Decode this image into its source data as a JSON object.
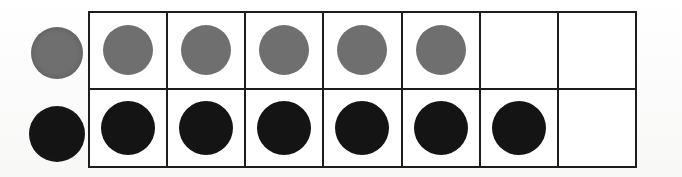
{
  "figure": {
    "background_color": "#ffffff",
    "border_color": "#1d1d1d",
    "border_width_px": 2
  },
  "key": {
    "name": "row-key-circles",
    "items": [
      {
        "name": "key-grey-circle",
        "color": "#6f6f6f",
        "shape": "circle",
        "row": "top",
        "diameter_px": 52
      },
      {
        "name": "key-black-circle",
        "color": "#141414",
        "shape": "circle",
        "row": "bottom",
        "diameter_px": 56
      }
    ]
  },
  "grid": {
    "columns": 7,
    "rows": 2,
    "column_labels": [
      "1",
      "2",
      "3",
      "4",
      "5",
      "6",
      "7"
    ],
    "rows_data": [
      {
        "name": "grey-row",
        "label": "Top row",
        "fill_color": "#6f6f6f",
        "count": 5,
        "cells": [
          "grey",
          "grey",
          "grey",
          "grey",
          "grey",
          "empty",
          "empty"
        ]
      },
      {
        "name": "black-row",
        "label": "Bottom row",
        "fill_color": "#141414",
        "count": 6,
        "cells": [
          "black",
          "black",
          "black",
          "black",
          "black",
          "black",
          "empty"
        ]
      }
    ]
  },
  "chart_data": {
    "type": "bar",
    "categories": [
      "Grey circles",
      "Black circles"
    ],
    "values": [
      5,
      6
    ],
    "xlabel": "Row",
    "ylabel": "Count",
    "ylim": [
      0,
      7
    ],
    "grid": true,
    "legend": "none",
    "colors": [
      "#6f6f6f",
      "#141414"
    ]
  }
}
